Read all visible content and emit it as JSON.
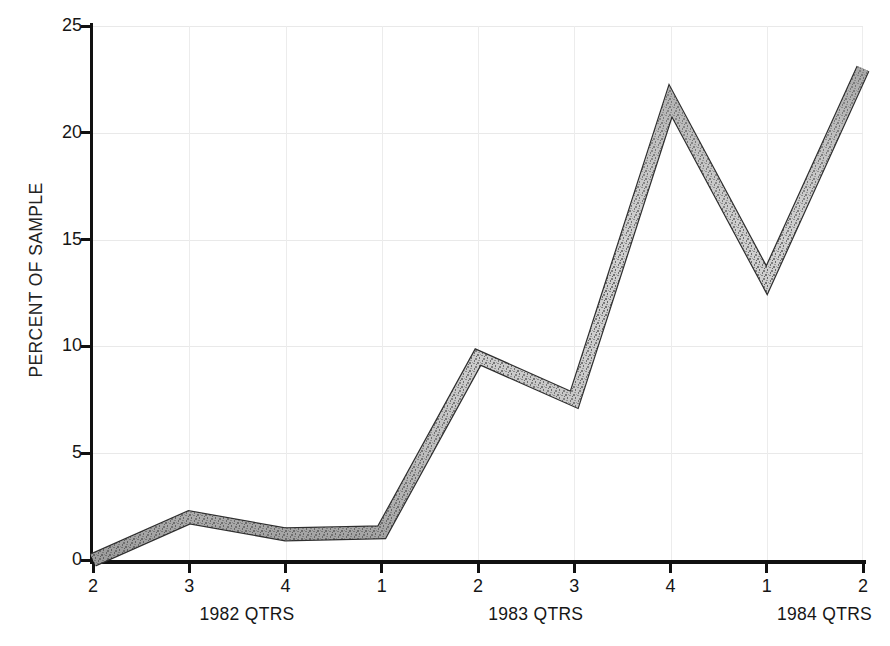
{
  "chart_data": {
    "type": "line",
    "title": "",
    "xlabel": "",
    "ylabel": "PERCENT OF SAMPLE",
    "ylim": [
      0,
      25
    ],
    "yticks": [
      0,
      5,
      10,
      15,
      20,
      25
    ],
    "ytick_labels": [
      "0",
      "5",
      "10",
      "15",
      "20",
      "25"
    ],
    "x": [
      "2",
      "3",
      "4",
      "1",
      "2",
      "3",
      "4",
      "1",
      "2"
    ],
    "xtick_labels": [
      "2",
      "3",
      "4",
      "1",
      "2",
      "3",
      "4",
      "1",
      "2"
    ],
    "x_group_labels": [
      "1982 QTRS",
      "1983 QTRS",
      "1984 QTRS"
    ],
    "categories": [
      "1982 Q2",
      "1982 Q3",
      "1982 Q4",
      "1983 Q1",
      "1983 Q2",
      "1983 Q3",
      "1983 Q4",
      "1984 Q1",
      "1984 Q2"
    ],
    "values": [
      0.0,
      2.0,
      1.2,
      1.3,
      9.5,
      7.5,
      21.5,
      13.1,
      23.0
    ],
    "series": [
      {
        "name": "Percent of sample",
        "values": [
          0.0,
          2.0,
          1.2,
          1.3,
          9.5,
          7.5,
          21.5,
          13.1,
          23.0
        ]
      }
    ],
    "grid": true,
    "grid_style": "faint",
    "legend": false,
    "legend_position": "none",
    "line_style": "thick textured band",
    "line_width_px": 12,
    "colors": {
      "axis": "#111111",
      "grid": "#ececec",
      "line_fill_light": "#d2d2d2",
      "line_fill_dark": "#6e6e6e",
      "line_outline": "#2b2b2b",
      "background": "#ffffff",
      "text": "#161616"
    }
  }
}
